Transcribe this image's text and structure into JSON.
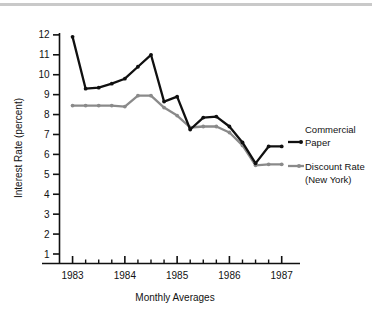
{
  "figure": {
    "top_rule_color": "#c9c9c9",
    "background": "#ffffff"
  },
  "axes": {
    "y_title": "Interest Rate (percent)",
    "x_title": "Monthly Averages",
    "y_ticks": [
      "1",
      "2",
      "3",
      "4",
      "5",
      "6",
      "7",
      "8",
      "9",
      "10",
      "11",
      "12"
    ],
    "x_ticks": [
      "1983",
      "1984",
      "1985",
      "1986",
      "1987"
    ]
  },
  "legend": {
    "commercial_line1": "Commercial",
    "commercial_line2": "Paper",
    "discount_line1": "Discount Rate",
    "discount_line2": "(New York)"
  },
  "chart_data": {
    "type": "line",
    "title": "",
    "xlabel": "Monthly Averages",
    "ylabel": "Interest Rate (percent)",
    "xlim": [
      1982.75,
      1987.35
    ],
    "ylim": [
      0,
      12.6
    ],
    "yticks": [
      1,
      2,
      3,
      4,
      5,
      6,
      7,
      8,
      9,
      10,
      11,
      12
    ],
    "xticks": [
      1983,
      1984,
      1985,
      1986,
      1987
    ],
    "x_minor_interval": 0.25,
    "grid": false,
    "legend_position": "right",
    "x": [
      1983.0,
      1983.25,
      1983.5,
      1983.75,
      1984.0,
      1984.25,
      1984.5,
      1984.75,
      1985.0,
      1985.25,
      1985.5,
      1985.75,
      1986.0,
      1986.25,
      1986.5,
      1986.75,
      1987.0
    ],
    "series": [
      {
        "name": "Commercial Paper",
        "color": "#101010",
        "values": [
          11.9,
          9.3,
          9.35,
          9.55,
          9.8,
          10.4,
          11.0,
          8.65,
          8.9,
          7.25,
          7.85,
          7.9,
          7.4,
          6.6,
          5.55,
          6.4,
          6.4
        ]
      },
      {
        "name": "Discount Rate (New York)",
        "color": "#8a8a8a",
        "values": [
          8.45,
          8.45,
          8.45,
          8.45,
          8.4,
          8.95,
          8.95,
          8.35,
          7.95,
          7.35,
          7.4,
          7.4,
          7.1,
          6.45,
          5.45,
          5.5,
          5.5
        ]
      }
    ]
  }
}
